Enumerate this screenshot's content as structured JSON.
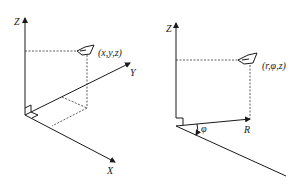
{
  "left_diagram": {
    "title": "Cartesian coordinate system",
    "axis_z": "Z",
    "axis_y": "Y",
    "axis_x": "X",
    "point_label": "(x,y,z)"
  },
  "right_diagram": {
    "title": "Cylindrical coordinate system",
    "axis_z": "Z",
    "axis_r": "R",
    "angle_label": "φ",
    "point_label": "(r,φ,z)"
  }
}
